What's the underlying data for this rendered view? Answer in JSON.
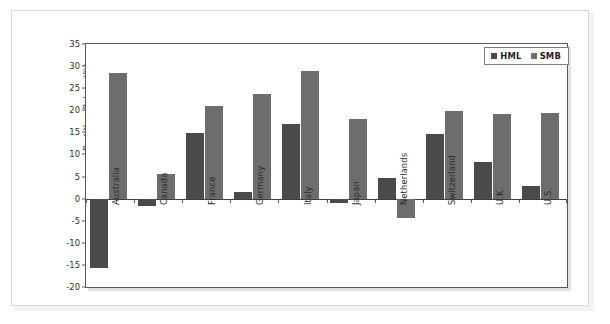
{
  "chart_data": {
    "type": "bar",
    "title": "",
    "subtitle": "",
    "xlabel": "",
    "ylabel": "Past Year Return (%)",
    "ylim": [
      -20,
      35
    ],
    "ytick_step": 5,
    "yticks": [
      "35",
      "30",
      "25",
      "20",
      "15",
      "10",
      "5",
      "0",
      "-5",
      "-10",
      "-15",
      "-20"
    ],
    "ytick_values": [
      35,
      30,
      25,
      20,
      15,
      10,
      5,
      0,
      -5,
      -10,
      -15,
      -20
    ],
    "grid": false,
    "legend_position": "top-right",
    "categories": [
      "Australia",
      "Canada",
      "France",
      "Germany",
      "Italy",
      "Japan",
      "Netherlands",
      "Switzerland",
      "U.K.",
      "U.S."
    ],
    "series": [
      {
        "name": "HML",
        "color": "#4b4b4b",
        "values": [
          -15.8,
          -1.7,
          14.8,
          1.5,
          17.0,
          -0.9,
          4.7,
          14.7,
          8.4,
          2.9
        ]
      },
      {
        "name": "SMB",
        "color": "#6d6d6d",
        "values": [
          28.5,
          5.6,
          21.0,
          23.6,
          29.0,
          18.0,
          -4.3,
          19.8,
          19.1,
          19.3
        ]
      }
    ]
  },
  "legend": {
    "items": [
      {
        "label": "HML",
        "key": "hml"
      },
      {
        "label": "SMB",
        "key": "smb"
      }
    ]
  }
}
